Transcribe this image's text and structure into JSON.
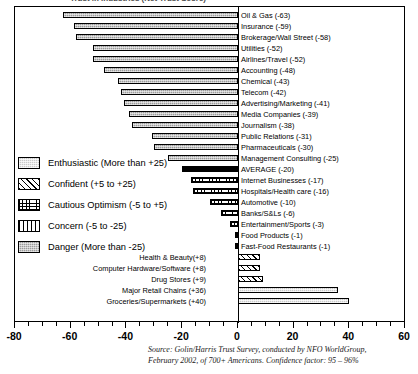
{
  "title": {
    "clipped_text": "Trust in Industries (Net Trust Score)"
  },
  "chart_data": {
    "type": "bar",
    "orientation": "horizontal",
    "title": "",
    "xlabel": "",
    "ylabel": "",
    "xlim": [
      -80,
      60
    ],
    "xticks": [
      -80,
      -60,
      -40,
      -20,
      0,
      20,
      40,
      60
    ],
    "xtick_labels": [
      "-80",
      "-60",
      "-40",
      "-20",
      "0",
      "20",
      "40",
      "60"
    ],
    "minor_tick_step": 5,
    "grid": false,
    "legend_position": "middle-left",
    "categories": [
      "Oil & Gas (-63)",
      "Insurance (-59)",
      "Brokerage/Wall Street (-58)",
      "Utilities (-52)",
      "Airlines/Travel (-52)",
      "Accounting (-48)",
      "Chemical (-43)",
      "Telecom (-42)",
      "Advertising/Marketing (-41)",
      "Media Companies (-39)",
      "Journalism (-38)",
      "Public Relations (-31)",
      "Pharmaceuticals (-30)",
      "Management Consulting (-25)",
      "AVERAGE (-20)",
      "Internet Businesses (-17)",
      "Hospitals/Health care (-16)",
      "Automotive (-10)",
      "Banks/S&Ls (-6)",
      "Entertainment/Sports (-3)",
      "Food Products (-1)",
      "Fast-Food Restaurants (-1)",
      "Health & Beauty(+8)",
      "Computer Hardware/Software (+8)",
      "Drug Stores (+9)",
      "Major Retail Chains (+36)",
      "Groceries/Supermarkets (+40)"
    ],
    "values": [
      -63,
      -59,
      -58,
      -52,
      -52,
      -48,
      -43,
      -42,
      -41,
      -39,
      -38,
      -31,
      -30,
      -25,
      -20,
      -17,
      -16,
      -10,
      -6,
      -3,
      -1,
      -1,
      8,
      8,
      9,
      36,
      40
    ],
    "bar_categories": [
      "danger",
      "danger",
      "danger",
      "danger",
      "danger",
      "danger",
      "danger",
      "danger",
      "danger",
      "danger",
      "danger",
      "danger",
      "danger",
      "danger",
      "average",
      "cautious",
      "cautious",
      "cautious",
      "cautious",
      "cautious",
      "cautious",
      "cautious",
      "confident",
      "confident",
      "confident",
      "enthusiastic",
      "enthusiastic"
    ],
    "label_side": [
      "right",
      "right",
      "right",
      "right",
      "right",
      "right",
      "right",
      "right",
      "right",
      "right",
      "right",
      "right",
      "right",
      "right",
      "right",
      "right",
      "right",
      "right",
      "right",
      "right",
      "right",
      "right",
      "left",
      "left",
      "left",
      "left",
      "left"
    ]
  },
  "legend": {
    "items": [
      {
        "label": "Enthusiastic (More than +25)",
        "pattern": "enthusiastic"
      },
      {
        "label": "Confident (+5 to +25)",
        "pattern": "confident"
      },
      {
        "label": "Cautious Optimism (-5 to +5)",
        "pattern": "cautious"
      },
      {
        "label": "Concern (-5 to -25)",
        "pattern": "concern"
      },
      {
        "label": "Danger (More than -25)",
        "pattern": "danger"
      }
    ]
  },
  "source": {
    "line1": "Source:  Golin/Harris Trust Survey, conducted by NFO WorldGroup,",
    "line2": "February 2002, of 700+ Americans. Confidence factor: 95 – 96%"
  }
}
